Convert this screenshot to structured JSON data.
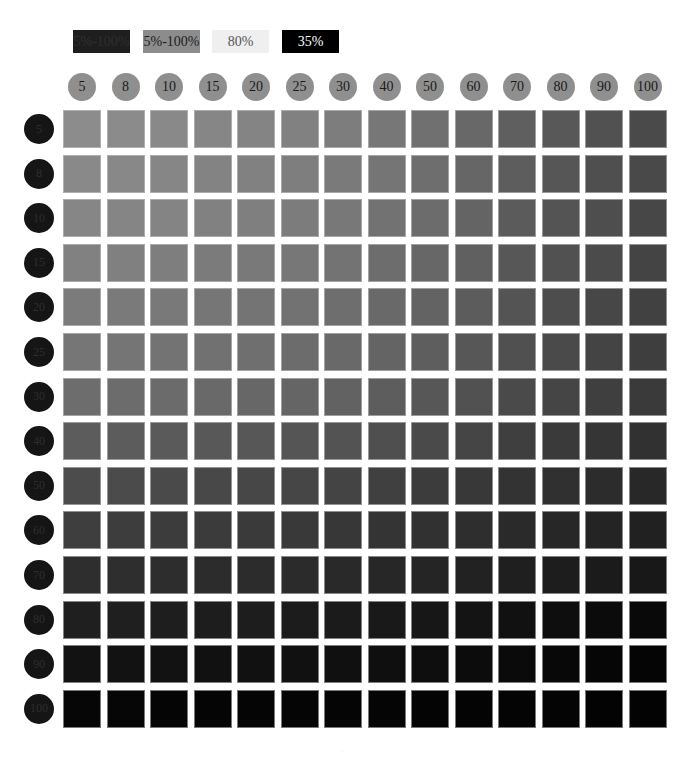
{
  "legend": [
    {
      "label": "5%-100%",
      "bg": "#1e1e1e",
      "fg": "#2f2f2f",
      "left": 73
    },
    {
      "label": "5%-100%",
      "bg": "#8c8c8c",
      "fg": "#1e1e1e",
      "left": 143
    },
    {
      "label": "80%",
      "bg": "#efefef",
      "fg": "#555555",
      "left": 212
    },
    {
      "label": "35%",
      "bg": "#000000",
      "fg": "#ffffff",
      "left": 282
    }
  ],
  "chart_data": {
    "type": "heatmap",
    "title": "",
    "legend_entries": [
      "5%-100%",
      "5%-100%",
      "80%",
      "35%"
    ],
    "x": [
      "5",
      "8",
      "10",
      "15",
      "20",
      "25",
      "30",
      "40",
      "50",
      "60",
      "70",
      "80",
      "90",
      "100"
    ],
    "y": [
      "5",
      "8",
      "10",
      "15",
      "20",
      "25",
      "30",
      "40",
      "50",
      "60",
      "70",
      "80",
      "90",
      "100"
    ],
    "xlabel": "",
    "ylabel": "",
    "value_meaning": "cell gray level (0=black, 255=white)",
    "values": [
      [
        140,
        139,
        137,
        134,
        132,
        129,
        125,
        119,
        112,
        104,
        95,
        88,
        81,
        74
      ],
      [
        137,
        136,
        134,
        131,
        129,
        126,
        122,
        117,
        110,
        102,
        93,
        86,
        79,
        73
      ],
      [
        134,
        133,
        132,
        129,
        127,
        124,
        120,
        114,
        108,
        100,
        91,
        84,
        78,
        71
      ],
      [
        129,
        128,
        126,
        123,
        121,
        119,
        115,
        109,
        103,
        96,
        87,
        81,
        75,
        68
      ],
      [
        123,
        122,
        121,
        118,
        116,
        114,
        110,
        105,
        99,
        92,
        84,
        77,
        71,
        65
      ],
      [
        118,
        117,
        115,
        113,
        111,
        108,
        105,
        100,
        94,
        87,
        80,
        74,
        68,
        62
      ],
      [
        109,
        108,
        107,
        105,
        103,
        101,
        98,
        93,
        87,
        81,
        74,
        69,
        63,
        58
      ],
      [
        92,
        92,
        90,
        88,
        87,
        85,
        83,
        79,
        74,
        69,
        63,
        58,
        53,
        49
      ],
      [
        76,
        75,
        74,
        72,
        71,
        70,
        68,
        64,
        60,
        56,
        51,
        48,
        44,
        40
      ],
      [
        62,
        61,
        60,
        59,
        58,
        57,
        55,
        52,
        49,
        46,
        42,
        39,
        36,
        33
      ],
      [
        46,
        46,
        45,
        44,
        44,
        43,
        41,
        39,
        37,
        34,
        31,
        29,
        27,
        24
      ],
      [
        31,
        31,
        30,
        29,
        29,
        28,
        27,
        25,
        23,
        20,
        17,
        14,
        11,
        9
      ],
      [
        18,
        18,
        18,
        17,
        17,
        17,
        16,
        15,
        14,
        12,
        10,
        8,
        6,
        5
      ],
      [
        6,
        6,
        5,
        5,
        5,
        5,
        5,
        5,
        4,
        4,
        4,
        4,
        3,
        3
      ]
    ]
  },
  "footer": {
    "text": "···"
  }
}
